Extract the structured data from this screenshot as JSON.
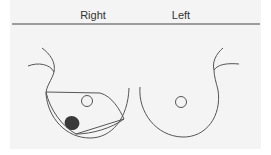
{
  "diagram": {
    "labels": {
      "right": "Right",
      "left": "Left"
    },
    "colors": {
      "background": "#f4f4f4",
      "stroke": "#555555",
      "lesion": "#3a3a3a"
    },
    "elements": [
      "header-line",
      "right-breast-outline",
      "right-breast-nipple",
      "right-breast-quadrant-wedge",
      "right-breast-lesion",
      "left-breast-outline",
      "left-breast-nipple",
      "axilla-curves"
    ]
  }
}
